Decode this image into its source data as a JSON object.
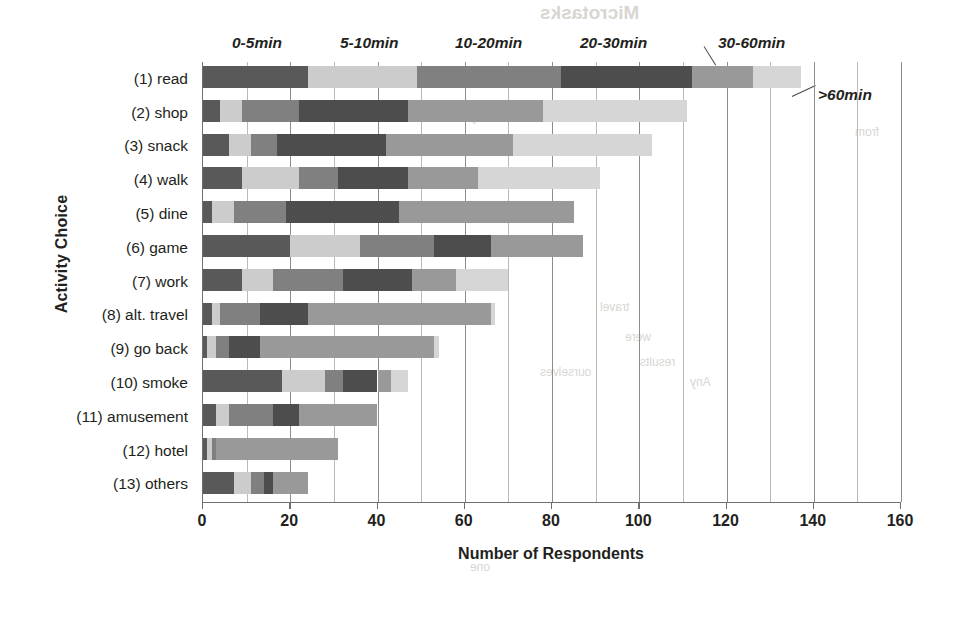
{
  "chart_data": {
    "type": "bar",
    "orientation": "horizontal",
    "stacked": true,
    "title": "",
    "xlabel": "Number of Respondents",
    "ylabel": "Activity Choice",
    "xlim": [
      0,
      160
    ],
    "xticks": [
      0,
      20,
      40,
      60,
      80,
      100,
      120,
      140,
      160
    ],
    "xtick_labels": [
      "0",
      "20",
      "40",
      "60",
      "80",
      "100",
      "120",
      "140",
      "160"
    ],
    "minor_tick_step": 10,
    "grid": "vertical",
    "legend_position": "top",
    "categories": [
      "(1) read",
      "(2) shop",
      "(3) snack",
      "(4) walk",
      "(5) dine",
      "(6) game",
      "(7) work",
      "(8) alt. travel",
      "(9) go back",
      "(10) smoke",
      "(11) amusement",
      "(12) hotel",
      "(13) others"
    ],
    "series": [
      {
        "name": "0-5min",
        "color": "#595959",
        "values": [
          24,
          4,
          6,
          9,
          2,
          20,
          9,
          2,
          1,
          18,
          3,
          1,
          7
        ]
      },
      {
        "name": "5-10min",
        "color": "#cccccc",
        "values": [
          25,
          5,
          5,
          13,
          5,
          16,
          7,
          2,
          2,
          10,
          3,
          1,
          4
        ]
      },
      {
        "name": "10-20min",
        "color": "#808080",
        "values": [
          33,
          13,
          6,
          9,
          12,
          17,
          16,
          9,
          3,
          4,
          10,
          1,
          3
        ]
      },
      {
        "name": "20-30min",
        "color": "#4d4d4d",
        "values": [
          30,
          25,
          25,
          16,
          26,
          13,
          16,
          11,
          7,
          8,
          6,
          0,
          2
        ]
      },
      {
        "name": "30-60min",
        "color": "#999999",
        "values": [
          14,
          31,
          29,
          16,
          40,
          21,
          10,
          42,
          40,
          3,
          18,
          28,
          8
        ]
      },
      {
        "name": ">60min",
        "color": "#d6d6d6",
        "values": [
          11,
          33,
          32,
          28,
          0,
          0,
          12,
          1,
          1,
          4,
          0,
          0,
          0
        ]
      }
    ],
    "totals": [
      137,
      111,
      103,
      91,
      85,
      87,
      70,
      67,
      54,
      47,
      40,
      31,
      24
    ],
    "legend_labels": [
      "0-5min",
      "5-10min",
      "10-20min",
      "20-30min",
      "30-60min",
      ">60min"
    ]
  },
  "background_ghost_text": {
    "title": "Microtasks",
    "lines": [
      "study",
      "travel",
      "were",
      "results",
      "Any",
      "one",
      "from",
      "ourselves"
    ]
  }
}
